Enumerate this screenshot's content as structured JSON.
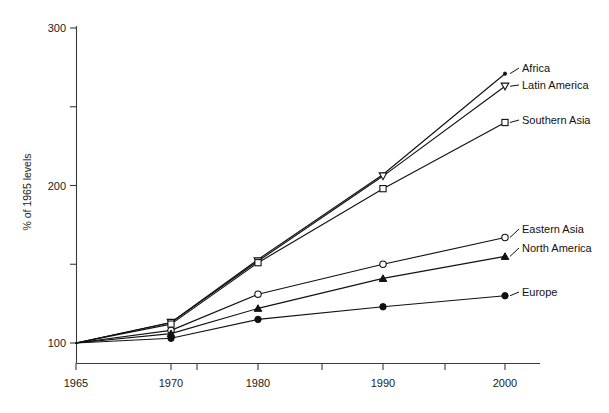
{
  "chart_data": {
    "type": "line",
    "title": "",
    "xlabel": "",
    "ylabel": "% of 1965 levels",
    "x": [
      1965,
      1970,
      1980,
      1990,
      2000
    ],
    "xtick_labels": [
      "1965",
      "1970",
      "1980",
      "1990",
      "2000"
    ],
    "xminor_ticks": [
      1975,
      1985,
      1995
    ],
    "ytick_labels": [
      "100",
      "200",
      "300"
    ],
    "yminor_tick_values": [
      150,
      250
    ],
    "ylim": [
      95,
      305
    ],
    "grid": false,
    "legend_position": "right-inline",
    "series": [
      {
        "name": "Africa",
        "marker": "dot-small",
        "values": [
          100,
          113,
          153,
          207,
          271
        ]
      },
      {
        "name": "Latin America",
        "marker": "open-triangle-down",
        "values": [
          100,
          113,
          152,
          206,
          263
        ]
      },
      {
        "name": "Southern Asia",
        "marker": "open-square",
        "values": [
          100,
          112,
          151,
          198,
          240
        ]
      },
      {
        "name": "Eastern Asia",
        "marker": "open-circle",
        "values": [
          100,
          108,
          131,
          150,
          167
        ]
      },
      {
        "name": "North America",
        "marker": "solid-triangle-up",
        "values": [
          100,
          106,
          122,
          141,
          155
        ]
      },
      {
        "name": "Europe",
        "marker": "solid-circle",
        "values": [
          100,
          103,
          115,
          123,
          130
        ]
      }
    ]
  },
  "axes": {
    "y_axis_title": "% of 1965 levels"
  }
}
